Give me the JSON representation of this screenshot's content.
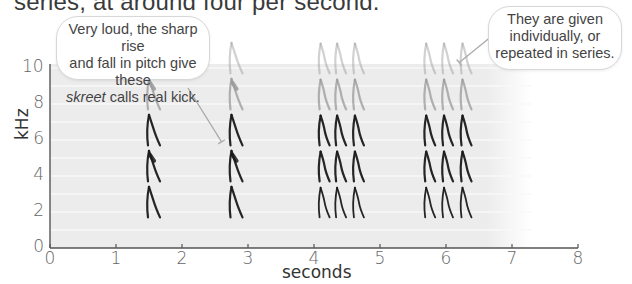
{
  "intro_text": "series, at around four per second.",
  "chart_data": {
    "type": "spectrogram",
    "title": "",
    "xlabel": "seconds",
    "ylabel": "kHz",
    "xlim": [
      0,
      8
    ],
    "ylim": [
      0,
      10
    ],
    "x_ticks": [
      "0",
      "1",
      "2",
      "3",
      "4",
      "5",
      "6",
      "7",
      "8"
    ],
    "y_ticks": [
      "0",
      "2",
      "4",
      "6",
      "8",
      "10"
    ],
    "grid": true,
    "calls": [
      {
        "group": "single",
        "time_s": 1.5,
        "harmonics_khz": [
          2,
          4,
          6,
          8,
          10
        ]
      },
      {
        "group": "single",
        "time_s": 2.75,
        "harmonics_khz": [
          2,
          4,
          6,
          8,
          10
        ]
      },
      {
        "group": "series-1",
        "time_s": 4.1,
        "harmonics_khz": [
          2,
          4,
          6,
          8,
          10
        ]
      },
      {
        "group": "series-1",
        "time_s": 4.35,
        "harmonics_khz": [
          2,
          4,
          6,
          8,
          10
        ]
      },
      {
        "group": "series-1",
        "time_s": 4.62,
        "harmonics_khz": [
          2,
          4,
          6,
          8,
          10
        ]
      },
      {
        "group": "series-2",
        "time_s": 5.7,
        "harmonics_khz": [
          2,
          4,
          6,
          8,
          10
        ]
      },
      {
        "group": "series-2",
        "time_s": 5.97,
        "harmonics_khz": [
          2,
          4,
          6,
          8,
          10
        ]
      },
      {
        "group": "series-2",
        "time_s": 6.25,
        "harmonics_khz": [
          2,
          4,
          6,
          8,
          10
        ]
      }
    ],
    "annotations": [
      {
        "id": "loud",
        "lines": [
          "Very loud, the sharp rise",
          "and fall in pitch give these"
        ],
        "italic_word": "skreet",
        "tail": " calls real kick.",
        "points_to_time_s": 2.6,
        "points_to_khz": 5.9
      },
      {
        "id": "series",
        "lines": [
          "They are given",
          "individually, or",
          "repeated in series."
        ],
        "points_to_time_s": 6.2,
        "points_to_khz": 10.3
      }
    ]
  },
  "colors": {
    "plot_bg": "#ececec",
    "grid": "#f8f8f8",
    "axis": "#555555",
    "trace_dark": "#1a1a1a",
    "trace_light": "#9a9a9a",
    "leader": "#aaaaaa"
  }
}
